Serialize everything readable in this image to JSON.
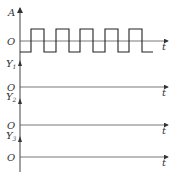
{
  "diagram": {
    "input_axis": {
      "y_label": "A",
      "origin_label": "O",
      "x_label": "t"
    },
    "output_axes": [
      {
        "y_label": "Y",
        "subscript": "1",
        "origin_label": "O",
        "x_label": "t"
      },
      {
        "y_label": "Y",
        "subscript": "2",
        "origin_label": "O",
        "x_label": "t"
      },
      {
        "y_label": "Y",
        "subscript": "3",
        "origin_label": "O",
        "x_label": "t"
      }
    ],
    "waveform": {
      "type": "square",
      "pulses": 5
    }
  },
  "colors": {
    "line": "#333333",
    "axis": "#555555"
  }
}
